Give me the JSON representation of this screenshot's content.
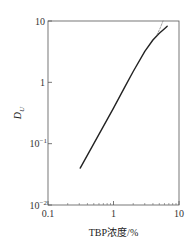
{
  "chart_data": {
    "type": "line",
    "title": "",
    "xlabel": "TBP浓度/%",
    "ylabel": "D_U",
    "ylabel_main": "D",
    "ylabel_sub": "U",
    "xscale": "log",
    "yscale": "log",
    "xlim": [
      0.1,
      10
    ],
    "ylim": [
      0.01,
      10
    ],
    "grid": false,
    "legend": null,
    "x_ticks": [
      {
        "value": 0.1,
        "label": "0.1"
      },
      {
        "value": 1,
        "label": "1"
      },
      {
        "value": 10,
        "label": "10"
      }
    ],
    "y_ticks": [
      {
        "value": 10,
        "label": "10",
        "exp": ""
      },
      {
        "value": 1,
        "label": "1",
        "exp": ""
      },
      {
        "value": 0.1,
        "label": "10",
        "exp": "−1"
      },
      {
        "value": 0.01,
        "label": "10",
        "exp": "−2"
      }
    ],
    "series": [
      {
        "name": "D_U (solid)",
        "style": "solid",
        "x": [
          0.31,
          0.5,
          1.0,
          1.5,
          2.0,
          3.0,
          4.0,
          5.0,
          6.0,
          6.6
        ],
        "y": [
          0.04,
          0.1,
          0.38,
          0.85,
          1.5,
          3.2,
          4.9,
          6.3,
          7.5,
          8.2
        ]
      },
      {
        "name": "extrapolation (dashed)",
        "style": "dashed",
        "x": [
          4.6,
          5.2,
          5.7
        ],
        "y": [
          5.9,
          7.8,
          10.0
        ]
      }
    ]
  }
}
